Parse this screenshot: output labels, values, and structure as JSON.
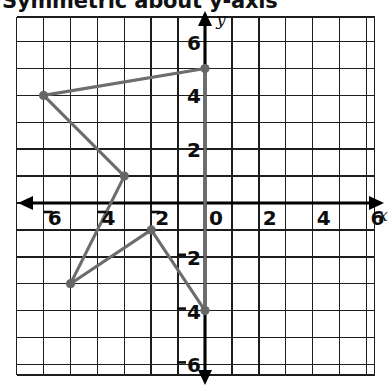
{
  "title": {
    "text": "Symmetric about y-axis",
    "clipped_top": true
  },
  "axes": {
    "x_label": "x",
    "y_label": "y",
    "x_ticks": [
      {
        "value": -6,
        "label": "6",
        "negative": true
      },
      {
        "value": -4,
        "label": "4",
        "negative": true
      },
      {
        "value": -2,
        "label": "2",
        "negative": true
      },
      {
        "value": 0,
        "label": "0",
        "negative": false
      },
      {
        "value": 2,
        "label": "2",
        "negative": false
      },
      {
        "value": 4,
        "label": "4",
        "negative": false
      },
      {
        "value": 6,
        "label": "6",
        "negative": false
      }
    ],
    "y_ticks": [
      {
        "value": 6,
        "label": "6",
        "negative": false
      },
      {
        "value": 4,
        "label": "4",
        "negative": false
      },
      {
        "value": 2,
        "label": "2",
        "negative": false
      },
      {
        "value": -2,
        "label": "2",
        "negative": true
      },
      {
        "value": -4,
        "label": "4",
        "negative": true
      },
      {
        "value": -6,
        "label": "6",
        "negative": true
      }
    ]
  },
  "colors": {
    "grid": "#1d1d1d",
    "axis": "#000000",
    "figure_stroke": "#6d6d6d",
    "vertex": "#666666",
    "background": "#ffffff",
    "text": "#0d0d0d"
  },
  "chart_data": {
    "type": "scatter",
    "title": "Symmetric about y-axis",
    "xlabel": "x",
    "ylabel": "y",
    "xlim": [
      -7,
      6.5
    ],
    "ylim": [
      -6.9,
      6.4
    ],
    "grid": true,
    "legend": null,
    "series": [
      {
        "name": "polygon",
        "closed": true,
        "points": [
          {
            "x": 0,
            "y": 5
          },
          {
            "x": -6,
            "y": 4
          },
          {
            "x": -3,
            "y": 1
          },
          {
            "x": -5,
            "y": -3
          },
          {
            "x": -2,
            "y": -1
          },
          {
            "x": 0,
            "y": -4
          }
        ]
      }
    ]
  }
}
